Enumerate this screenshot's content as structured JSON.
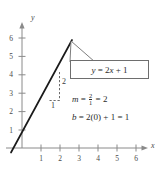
{
  "figure": {
    "type": "graph-of-line",
    "background": "#ffffff",
    "axis_color": "#8a8a8a",
    "line_color": "#1a1a1a",
    "text_color": "#2a2a2a"
  },
  "axes": {
    "x_label": "x",
    "y_label": "y",
    "x_ticks": [
      "1",
      "2",
      "3",
      "4",
      "5",
      "6"
    ],
    "y_ticks": [
      "1",
      "2",
      "3",
      "4",
      "5",
      "6"
    ],
    "x_range": [
      -0.9,
      6.7
    ],
    "y_range": [
      -0.6,
      6.9
    ]
  },
  "graph": {
    "equation": "y = 2x + 1",
    "slope": 2,
    "intercept": 1,
    "segment": {
      "x1": -0.6,
      "y1": -0.2,
      "x2": 2.6,
      "y2": 6.2
    }
  },
  "callout": {
    "label": "y = 2x + 1",
    "label_parts": {
      "y": "y",
      "eq": " = 2",
      "x": "x",
      "plus": " + 1"
    }
  },
  "slope_triangle": {
    "rise_label": "2",
    "run_label": "1"
  },
  "annotations": {
    "slope_line": {
      "m": "m",
      "eq1": " = ",
      "num": "2",
      "den": "1",
      "eq2": " = 2"
    },
    "intercept_line": {
      "b": "b",
      "expr": " = 2(0) + 1 = 1"
    }
  }
}
